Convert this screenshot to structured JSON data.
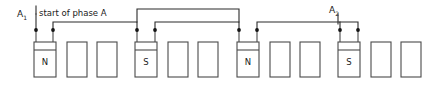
{
  "diagram": {
    "title_caption": "start of phase A",
    "terminals": [
      {
        "id": "A1",
        "base": "A",
        "sub": "1",
        "x": 17,
        "y": 16
      },
      {
        "id": "A2",
        "base": "A",
        "sub": "2",
        "x": 330,
        "y": 13
      }
    ],
    "pole_labels": [
      {
        "text": "N",
        "x": 45,
        "y": 62
      },
      {
        "text": "S",
        "x": 146,
        "y": 62
      },
      {
        "text": "N",
        "x": 248,
        "y": 62
      },
      {
        "text": "S",
        "x": 349,
        "y": 62
      }
    ],
    "slots": [
      {
        "index": 1,
        "x": 34,
        "y": 42,
        "w": 22,
        "h": 35,
        "coil": true,
        "pole": "N"
      },
      {
        "index": 2,
        "x": 67,
        "y": 42,
        "w": 20,
        "h": 35,
        "coil": false,
        "pole": ""
      },
      {
        "index": 3,
        "x": 97,
        "y": 42,
        "w": 20,
        "h": 35,
        "coil": false,
        "pole": ""
      },
      {
        "index": 4,
        "x": 135,
        "y": 42,
        "w": 22,
        "h": 35,
        "coil": true,
        "pole": "S"
      },
      {
        "index": 5,
        "x": 168,
        "y": 42,
        "w": 20,
        "h": 35,
        "coil": false,
        "pole": ""
      },
      {
        "index": 6,
        "x": 198,
        "y": 42,
        "w": 20,
        "h": 35,
        "coil": false,
        "pole": ""
      },
      {
        "index": 7,
        "x": 237,
        "y": 42,
        "w": 22,
        "h": 35,
        "coil": true,
        "pole": "N"
      },
      {
        "index": 8,
        "x": 270,
        "y": 42,
        "w": 20,
        "h": 35,
        "coil": false,
        "pole": ""
      },
      {
        "index": 9,
        "x": 300,
        "y": 42,
        "w": 20,
        "h": 35,
        "coil": false,
        "pole": ""
      },
      {
        "index": 10,
        "x": 338,
        "y": 42,
        "w": 22,
        "h": 35,
        "coil": true,
        "pole": "S"
      },
      {
        "index": 11,
        "x": 371,
        "y": 42,
        "w": 20,
        "h": 35,
        "coil": false,
        "pole": ""
      },
      {
        "index": 12,
        "x": 401,
        "y": 42,
        "w": 20,
        "h": 35,
        "coil": false,
        "pole": ""
      }
    ],
    "nodes": [
      {
        "name": "node-a1-lead",
        "x": 36,
        "y": 30
      },
      {
        "name": "node-coil1-right",
        "x": 53,
        "y": 30
      },
      {
        "name": "node-coil2-left",
        "x": 137,
        "y": 30
      },
      {
        "name": "node-coil2-right",
        "x": 155,
        "y": 30
      },
      {
        "name": "node-coil3-left",
        "x": 239,
        "y": 30
      },
      {
        "name": "node-coil3-right",
        "x": 257,
        "y": 30
      },
      {
        "name": "node-coil4-left",
        "x": 340,
        "y": 30
      },
      {
        "name": "node-coil4-right",
        "x": 358,
        "y": 30
      }
    ],
    "wire_paths": [
      {
        "name": "lead-a1-vertical",
        "d": "M 36 17 L 36 42"
      },
      {
        "name": "coil1-right-riser",
        "d": "M 53 42 L 53 30"
      },
      {
        "name": "link-coil1-coil2",
        "d": "M 53 22 L 137 22 L 137 42"
      },
      {
        "name": "link-coil1-coil2-stub",
        "d": "M 53 30 L 53 22"
      },
      {
        "name": "coil2-left-riser",
        "d": "M 137 30 L 137 22"
      },
      {
        "name": "coil2-right-riser",
        "d": "M 155 42 L 155 30"
      },
      {
        "name": "upper-loop-coil2-coil3",
        "d": "M 137 9 L 239 9"
      },
      {
        "name": "upper-loop-left-drop",
        "d": "M 137 9 L 137 22"
      },
      {
        "name": "upper-loop-right-drop",
        "d": "M 239 9 L 239 30"
      },
      {
        "name": "link-coil2r-coil3l",
        "d": "M 155 30 L 155 22 L 239 22"
      },
      {
        "name": "coil3-right-riser",
        "d": "M 257 42 L 257 30"
      },
      {
        "name": "link-coil3-coil4",
        "d": "M 257 30 L 257 22 L 340 22 L 340 42"
      },
      {
        "name": "coil4-right-riser",
        "d": "M 358 42 L 358 30"
      },
      {
        "name": "lead-a2-run",
        "d": "M 358 30 L 358 22 L 340 22"
      },
      {
        "name": "terminal-a2-marker",
        "d": "M 338 17 L 338 26"
      },
      {
        "name": "terminal-a1-marker",
        "d": "M 36 17 L 36 26"
      },
      {
        "name": "caption-tick",
        "d": "M 36 10 L 36 17"
      }
    ],
    "colors": {
      "wire": "#2b2b2b",
      "slot_outline": "#4a4a4a",
      "node": "#141414",
      "text": "#1a1a1a",
      "background": "#ffffff"
    }
  }
}
